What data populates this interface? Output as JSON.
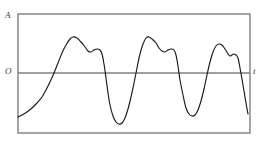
{
  "figure": {
    "kind": "waveform-plot",
    "caption": "",
    "axes": {
      "vertical_label": "A",
      "origin_label": "O",
      "horizontal_label": "t"
    },
    "colors": {
      "frame": "#808080",
      "axis": "#808080",
      "curve": "#1a1a1a",
      "background": "#ffffff",
      "label": "#3a3a3a"
    },
    "frame": {
      "left": 18,
      "top": 14,
      "right": 250,
      "bottom": 133
    },
    "baseline_y": 73
  },
  "chart_data": {
    "type": "line",
    "title": "",
    "subtitle": "",
    "xlabel": "t",
    "ylabel": "A",
    "annotations": [
      "A",
      "O",
      "t"
    ],
    "grid": false,
    "legend": null,
    "axis_style": "box-frame-with-zero-line",
    "zero_line": true,
    "xlim": [
      18,
      250
    ],
    "ylim": [
      133,
      14
    ],
    "series": [
      {
        "name": "amplitude",
        "color": "#1a1a1a",
        "description": "Quasi-periodic oscillation, roughly three cycles, each cycle having a rounded main crest, a small notch, a secondary shoulder crest, then a steep fall to a rounded trough.",
        "cycles": 3,
        "points": [
          [
            18,
            117
          ],
          [
            22,
            115
          ],
          [
            27,
            112
          ],
          [
            32,
            108
          ],
          [
            37,
            103
          ],
          [
            42,
            97
          ],
          [
            46,
            90
          ],
          [
            50,
            82
          ],
          [
            54,
            73
          ],
          [
            58,
            63
          ],
          [
            62,
            53
          ],
          [
            66,
            45
          ],
          [
            70,
            39
          ],
          [
            73,
            37
          ],
          [
            77,
            38
          ],
          [
            81,
            42
          ],
          [
            85,
            47
          ],
          [
            88,
            51
          ],
          [
            91,
            52
          ],
          [
            94,
            50
          ],
          [
            97,
            49
          ],
          [
            100,
            50
          ],
          [
            102,
            54
          ],
          [
            104,
            64
          ],
          [
            106,
            78
          ],
          [
            108,
            93
          ],
          [
            110,
            105
          ],
          [
            113,
            116
          ],
          [
            116,
            122
          ],
          [
            119,
            124
          ],
          [
            122,
            123
          ],
          [
            125,
            118
          ],
          [
            128,
            109
          ],
          [
            131,
            97
          ],
          [
            134,
            83
          ],
          [
            137,
            68
          ],
          [
            140,
            54
          ],
          [
            143,
            44
          ],
          [
            146,
            38
          ],
          [
            149,
            37
          ],
          [
            152,
            39
          ],
          [
            156,
            43
          ],
          [
            159,
            48
          ],
          [
            162,
            51
          ],
          [
            165,
            52
          ],
          [
            168,
            50
          ],
          [
            171,
            49
          ],
          [
            174,
            50
          ],
          [
            176,
            55
          ],
          [
            178,
            66
          ],
          [
            180,
            80
          ],
          [
            183,
            95
          ],
          [
            186,
            108
          ],
          [
            189,
            114
          ],
          [
            192,
            116
          ],
          [
            195,
            115
          ],
          [
            198,
            110
          ],
          [
            201,
            101
          ],
          [
            204,
            89
          ],
          [
            207,
            75
          ],
          [
            210,
            62
          ],
          [
            213,
            52
          ],
          [
            216,
            46
          ],
          [
            219,
            44
          ],
          [
            222,
            45
          ],
          [
            225,
            49
          ],
          [
            228,
            54
          ],
          [
            230,
            56
          ],
          [
            232,
            55
          ],
          [
            234,
            54
          ],
          [
            236,
            55
          ],
          [
            238,
            58
          ],
          [
            240,
            68
          ],
          [
            243,
            85
          ],
          [
            246,
            103
          ],
          [
            248,
            114
          ]
        ]
      }
    ]
  }
}
